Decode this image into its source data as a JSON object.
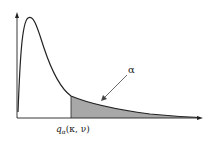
{
  "figure": {
    "quantile_label_main": "q",
    "quantile_label_sub": "α",
    "quantile_label_args": "(κ, ν)",
    "tail_label": "α",
    "colors": {
      "curve": "#222222",
      "shade": "#a8a8a8",
      "axis": "#222222"
    }
  }
}
